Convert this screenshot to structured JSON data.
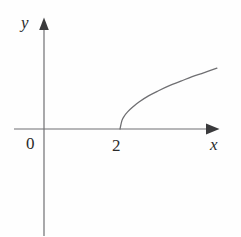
{
  "figure": {
    "background_color": "#fefefe",
    "stroke_color": "#6f6f72",
    "text_color": "#2b2b2b",
    "axis_labels": {
      "x": "x",
      "y": "y"
    },
    "tick_labels": {
      "origin": "0",
      "x_tick_2": "2"
    }
  },
  "chart_data": {
    "type": "line",
    "title": "",
    "xlabel": "x",
    "ylabel": "y",
    "grid": false,
    "legend": null,
    "annotations": [
      {
        "text": "0",
        "role": "origin-label",
        "x": 0,
        "y": 0
      },
      {
        "text": "2",
        "role": "x-axis-tick",
        "x": 2,
        "y": 0
      }
    ],
    "axes": {
      "x_axis": {
        "arrow": true,
        "pixel_y": 129,
        "pixel_x_start": 14,
        "pixel_x_end": 219
      },
      "y_axis": {
        "arrow": true,
        "pixel_x": 44,
        "pixel_y_top": 18,
        "pixel_y_end": 236
      },
      "origin_pixel": {
        "x": 44,
        "y": 129
      },
      "x_unit_pixels": 38,
      "xlim": [
        -0.8,
        4.6
      ],
      "ylim": [
        -2.9,
        2.9
      ]
    },
    "series": [
      {
        "name": "y = sqrt(x - 2)",
        "domain_start": 2,
        "domain_end": 4.55,
        "points": [
          {
            "x": 2.0,
            "y": 0.0
          },
          {
            "x": 2.05,
            "y": 0.22
          },
          {
            "x": 2.1,
            "y": 0.32
          },
          {
            "x": 2.2,
            "y": 0.45
          },
          {
            "x": 2.35,
            "y": 0.59
          },
          {
            "x": 2.5,
            "y": 0.71
          },
          {
            "x": 2.75,
            "y": 0.87
          },
          {
            "x": 3.0,
            "y": 1.0
          },
          {
            "x": 3.3,
            "y": 1.14
          },
          {
            "x": 3.6,
            "y": 1.26
          },
          {
            "x": 3.9,
            "y": 1.38
          },
          {
            "x": 4.2,
            "y": 1.48
          },
          {
            "x": 4.55,
            "y": 1.6
          }
        ],
        "pixel_points": [
          {
            "x": 120.0,
            "y": 129.0
          },
          {
            "x": 121.9,
            "y": 120.6
          },
          {
            "x": 123.8,
            "y": 116.8
          },
          {
            "x": 127.6,
            "y": 111.9
          },
          {
            "x": 133.3,
            "y": 106.6
          },
          {
            "x": 139.0,
            "y": 102.0
          },
          {
            "x": 148.5,
            "y": 95.9
          },
          {
            "x": 158.0,
            "y": 91.0
          },
          {
            "x": 169.4,
            "y": 85.7
          },
          {
            "x": 180.8,
            "y": 81.2
          },
          {
            "x": 192.2,
            "y": 76.6
          },
          {
            "x": 203.6,
            "y": 72.8
          },
          {
            "x": 216.9,
            "y": 68.2
          }
        ]
      }
    ]
  }
}
